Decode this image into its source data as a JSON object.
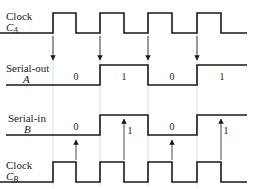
{
  "diagram": {
    "type": "timing-diagram",
    "colors": {
      "signal": "#1a1a1a",
      "guide": "#c9dbe6",
      "arrow": "#333333",
      "clockB_low": "#7a3a30"
    },
    "signals": [
      {
        "id": "clock_a",
        "label_line1": "Clock",
        "label_main": "C",
        "label_sub": "A",
        "high_y": 13,
        "low_y": 33,
        "points": "0,33 53,33 53,13 76,13 76,33 100,33 100,13 124,13 124,33 148,33 148,13 172,13 172,33 197,33 197,13 221,13 221,33 247,33"
      },
      {
        "id": "serial_out_a",
        "label_line1": "Serial-out",
        "label_main": "A",
        "high_y": 65,
        "low_y": 85,
        "points": "6,85 100,85 100,65 148,65 148,85 197,85 197,65 247,65",
        "bits": [
          {
            "value": "0",
            "x": 76,
            "y": 80
          },
          {
            "value": "1",
            "x": 124,
            "y": 80
          },
          {
            "value": "0",
            "x": 172,
            "y": 80
          },
          {
            "value": "1",
            "x": 222,
            "y": 80
          }
        ]
      },
      {
        "id": "serial_in_b",
        "label_line1": "Serial-in",
        "label_main": "B",
        "high_y": 115,
        "low_y": 135,
        "points": "6,135 100,135 100,115 148,115 148,135 197,135 197,115 247,115",
        "bits": [
          {
            "value": "0",
            "x": 76,
            "y": 130
          },
          {
            "value": "1",
            "x": 130,
            "y": 134
          },
          {
            "value": "0",
            "x": 172,
            "y": 130
          },
          {
            "value": "1",
            "x": 226,
            "y": 134
          }
        ]
      },
      {
        "id": "clock_b",
        "label_line1": "Clock",
        "label_main": "C",
        "label_sub": "B",
        "high_y": 162,
        "low_y": 182,
        "points": "0,182 53,182 53,162 76,162 76,182 100,182 100,162 124,162 124,182 148,182 148,162 172,162 172,182 197,182 197,162 221,162 221,182 247,182"
      }
    ],
    "guide_lines_x": [
      53,
      100,
      148,
      197
    ],
    "down_arrows": [
      {
        "x": 53,
        "y1": 36,
        "y2": 60
      },
      {
        "x": 100,
        "y1": 36,
        "y2": 60
      },
      {
        "x": 148,
        "y1": 36,
        "y2": 60
      },
      {
        "x": 197,
        "y1": 36,
        "y2": 60
      }
    ],
    "up_arrows": [
      {
        "x": 76,
        "y1": 160,
        "y2": 140
      },
      {
        "x": 124,
        "y1": 160,
        "y2": 119
      },
      {
        "x": 172,
        "y1": 160,
        "y2": 140
      },
      {
        "x": 221,
        "y1": 160,
        "y2": 119
      }
    ]
  }
}
